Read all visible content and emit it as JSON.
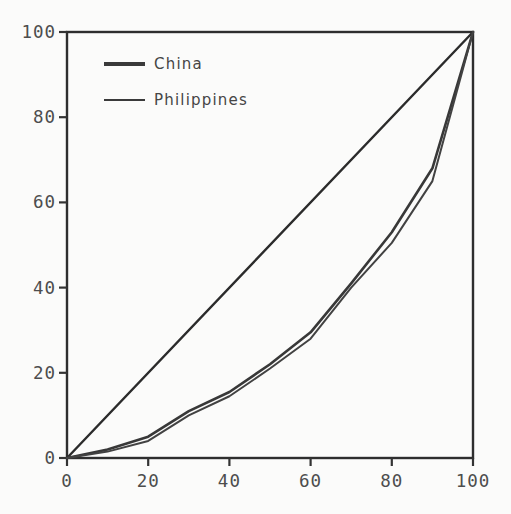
{
  "figure": {
    "background": "#fbfbfa",
    "axes_color": "#2e2e2e",
    "tick_color": "#333333",
    "tick_label_color": "#4d4d4d"
  },
  "chart_data": {
    "type": "line",
    "title": "",
    "subtitle": "",
    "xlabel": "",
    "ylabel": "",
    "xlim": [
      0,
      100
    ],
    "ylim": [
      0,
      100
    ],
    "x_ticks": [
      0,
      20,
      40,
      60,
      80,
      100
    ],
    "y_ticks": [
      0,
      20,
      40,
      60,
      80,
      100
    ],
    "grid": false,
    "legend_position": "upper-left-inside",
    "x": [
      0,
      10,
      20,
      30,
      40,
      50,
      60,
      70,
      80,
      90,
      100
    ],
    "series": [
      {
        "name": "China",
        "color": "#383838",
        "stroke_width": 2.6,
        "values": [
          0,
          2,
          5,
          11,
          15.5,
          22,
          29.5,
          41,
          53,
          68,
          100
        ]
      },
      {
        "name": "Philippines",
        "color": "#424242",
        "stroke_width": 2,
        "values": [
          0,
          1.5,
          4,
          10,
          14.5,
          21,
          28,
          40,
          50.5,
          65,
          100
        ]
      }
    ],
    "reference_line": {
      "name": "line-of-equality",
      "color": "#2b2b2b",
      "x": [
        0,
        100
      ],
      "y": [
        0,
        100
      ]
    }
  }
}
